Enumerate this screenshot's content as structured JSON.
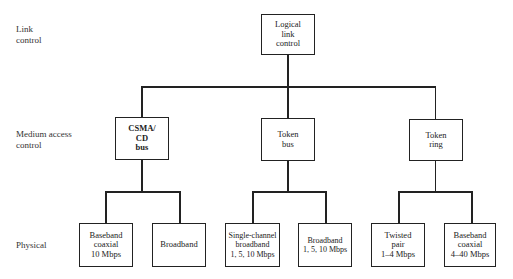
{
  "layers": {
    "link": "Link\ncontrol",
    "mac": "Medium access\ncontrol",
    "physical": "Physical"
  },
  "root": {
    "label": "Logical\nlink\ncontrol"
  },
  "mac_nodes": [
    {
      "label": "CSMA/\nCD\nbus"
    },
    {
      "label": "Token\nbus"
    },
    {
      "label": "Token\nring"
    }
  ],
  "physical_nodes": [
    {
      "label": "Baseband\ncoaxial\n10 Mbps"
    },
    {
      "label": "Broadband"
    },
    {
      "label": "Single-channel\nbroadband\n1, 5, 10 Mbps"
    },
    {
      "label": "Broadband\n1, 5, 10 Mbps"
    },
    {
      "label": "Twisted\npair\n1–4 Mbps"
    },
    {
      "label": "Baseband\ncoaxial\n4–40 Mbps"
    }
  ]
}
